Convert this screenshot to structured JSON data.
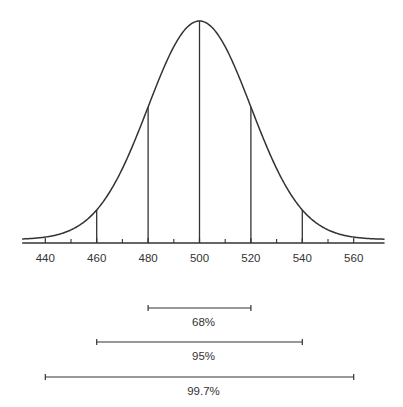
{
  "chart_data": {
    "type": "line",
    "title": "",
    "subtitle": "",
    "xlabel": "",
    "ylabel": "",
    "distribution": {
      "mean": 500,
      "sd": 20
    },
    "xlim": [
      431,
      572
    ],
    "grid": false,
    "x_tick_labels": [
      "440",
      "460",
      "480",
      "500",
      "520",
      "540",
      "560"
    ],
    "major_ticks": [
      440,
      460,
      480,
      500,
      520,
      540,
      560
    ],
    "minor_ticks": [
      450,
      470,
      490,
      510,
      530,
      550
    ],
    "vertical_lines": [
      460,
      480,
      500,
      520,
      540
    ],
    "intervals": [
      {
        "label": "68%",
        "from": 480,
        "to": 520
      },
      {
        "label": "95%",
        "from": 460,
        "to": 540
      },
      {
        "label": "99.7%",
        "from": 440,
        "to": 560
      }
    ],
    "colors": {
      "line": "#333333",
      "text": "#333333",
      "background": "#ffffff"
    }
  }
}
